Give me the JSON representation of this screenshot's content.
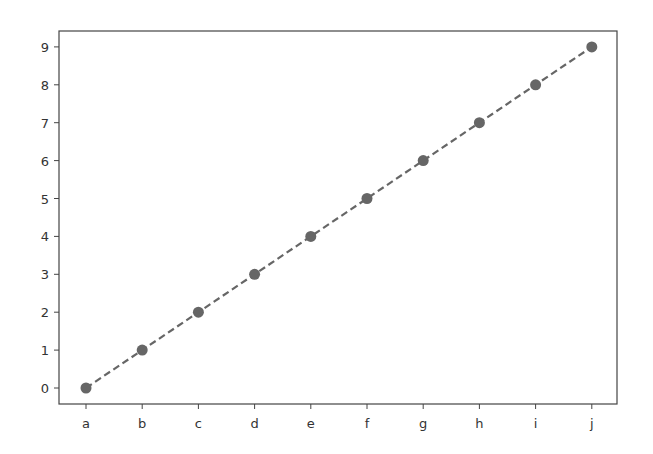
{
  "chart_data": {
    "type": "line",
    "title": "",
    "xlabel": "",
    "ylabel": "",
    "categories": [
      "a",
      "b",
      "c",
      "d",
      "e",
      "f",
      "g",
      "h",
      "i",
      "j"
    ],
    "series": [
      {
        "name": "",
        "values": [
          0,
          1,
          2,
          3,
          4,
          5,
          6,
          7,
          8,
          9
        ],
        "color": "#666666",
        "linestyle": "dashed",
        "marker": "circle"
      }
    ],
    "yticks": [
      "0",
      "1",
      "2",
      "3",
      "4",
      "5",
      "6",
      "7",
      "8",
      "9"
    ],
    "ylim": [
      -0.4,
      9.4
    ],
    "grid": false,
    "legend": null
  }
}
